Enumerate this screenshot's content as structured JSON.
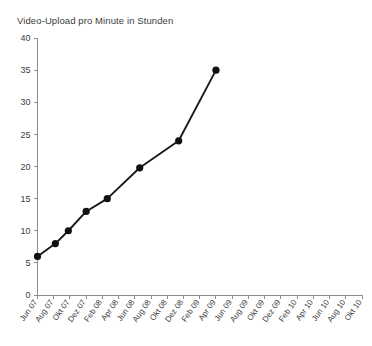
{
  "chart_data": {
    "type": "line",
    "title": "Video-Upload pro Minute in Stunden",
    "xlabel": "",
    "ylabel": "",
    "ylim": [
      0,
      40
    ],
    "ytick_step": 5,
    "yticks": [
      "0",
      "5",
      "10",
      "15",
      "20",
      "25",
      "30",
      "35",
      "40"
    ],
    "grid": false,
    "legend": "none",
    "categories": [
      "Jun 07",
      "Aug 07",
      "Okt 07",
      "Dez 07",
      "Feb 08",
      "Apr 08",
      "Jun 08",
      "Aug 08",
      "Okt 08",
      "Dez 08",
      "Feb 09",
      "Apr 09",
      "Jun 09",
      "Aug 09",
      "Okt 09",
      "Dez 09",
      "Feb 10",
      "Apr 10",
      "Jun 10",
      "Aug 10",
      "Okt 10"
    ],
    "series": [
      {
        "name": "Video-Upload pro Minute in Stunden",
        "color": "#111111",
        "points": [
          {
            "x": "Jun 07",
            "x_index": 0.0,
            "y": 6
          },
          {
            "x": "Okt 07",
            "x_index": 1.1,
            "y": 8
          },
          {
            "x": "Dez 07",
            "x_index": 1.9,
            "y": 10
          },
          {
            "x": "Mrz 08",
            "x_index": 3.0,
            "y": 13
          },
          {
            "x": "Aug 08",
            "x_index": 4.3,
            "y": 15
          },
          {
            "x": "Mai 09",
            "x_index": 6.3,
            "y": 19.8
          },
          {
            "x": "Jan 10",
            "x_index": 8.7,
            "y": 24
          },
          {
            "x": "Okt 10",
            "x_index": 11.0,
            "y": 35
          }
        ]
      }
    ]
  },
  "colors": {
    "axis": "#8e8e8e",
    "line": "#111111",
    "text": "#3c3c3c",
    "background": "#ffffff"
  }
}
